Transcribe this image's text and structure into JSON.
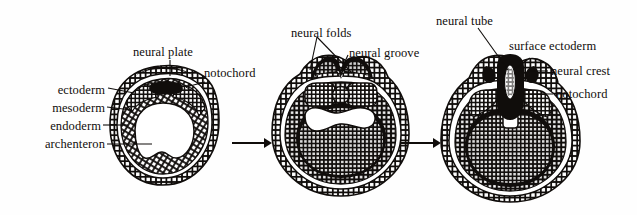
{
  "figure": {
    "stages": [
      {
        "name": "neural-plate-stage",
        "labels": [
          "ectoderm",
          "mesoderm",
          "endoderm",
          "archenteron",
          "neural plate",
          "notochord"
        ]
      },
      {
        "name": "neural-groove-stage",
        "labels": [
          "neural folds",
          "neural groove"
        ]
      },
      {
        "name": "neural-tube-stage",
        "labels": [
          "neural tube",
          "surface ectoderm",
          "neural crest",
          "notochord"
        ]
      }
    ]
  },
  "labels": {
    "ectoderm": "ectoderm",
    "mesoderm": "mesoderm",
    "endoderm": "endoderm",
    "archenteron": "archenteron",
    "neural_plate": "neural plate",
    "notochord_left": "notochord",
    "neural_folds": "neural folds",
    "neural_groove": "neural groove",
    "neural_tube": "neural tube",
    "surface_ectoderm": "surface ectoderm",
    "neural_crest": "neural crest",
    "notochord_right": "notochord"
  },
  "arrows": {
    "arrow_one": "→",
    "arrow_two": "→"
  },
  "colors": {
    "ink": "#100d0b",
    "background": "#fefefe",
    "cell_fill": "#ffffff",
    "cavity": "#ffffff"
  }
}
